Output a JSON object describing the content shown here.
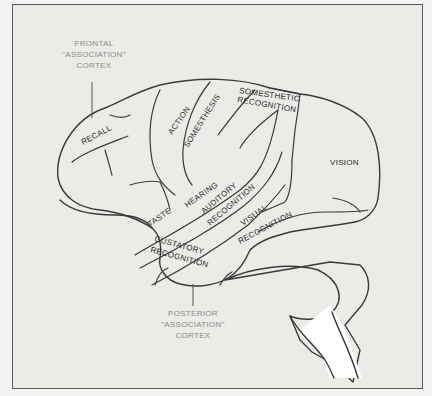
{
  "figure": {
    "colors": {
      "background": "#ebebe8",
      "brain_fill": "#ffffff",
      "outline": "#3a3a3a",
      "region_label": "#2a2a2a",
      "callout_label": "#8a8a8a",
      "frame_border": "#5a5a5a"
    }
  },
  "callouts": {
    "frontal": {
      "line1": "FRONTAL",
      "line2": "\"ASSOCIATION\"",
      "line3": "CORTEX"
    },
    "posterior": {
      "line1": "POSTERIOR",
      "line2": "\"ASSOCIATION\"",
      "line3": "CORTEX"
    }
  },
  "regions": {
    "recall": "RECALL",
    "action": "ACTION",
    "somesthesis": "SOMESTHESIS",
    "somesthetic_recognition_1": "SOMESTHETIC",
    "somesthetic_recognition_2": "RECOGNITION",
    "vision": "VISION",
    "taste": "TASTE",
    "hearing": "HEARING",
    "auditory_recognition_1": "AUDITORY",
    "auditory_recognition_2": "RECOGNITION",
    "visual_recognition_1": "VISUAL",
    "visual_recognition_2": "RECOGNITION",
    "gustatory_recognition_1": "GUSTATORY",
    "gustatory_recognition_2": "RECOGNITION"
  }
}
